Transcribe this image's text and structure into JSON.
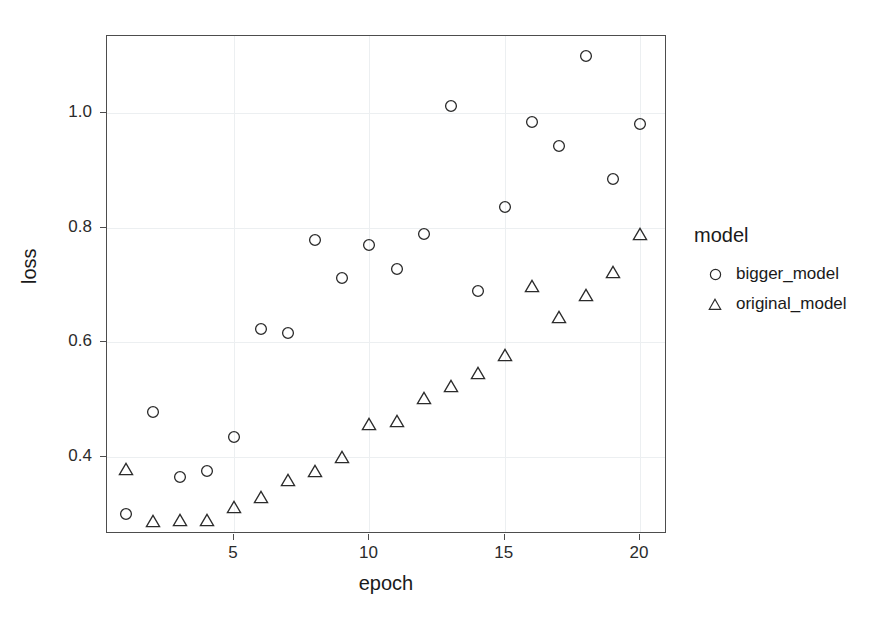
{
  "chart_data": {
    "type": "scatter",
    "title": "",
    "xlabel": "epoch",
    "ylabel": "loss",
    "xlim": [
      0.3,
      21.0
    ],
    "ylim": [
      0.265,
      1.135
    ],
    "xticks": [
      5,
      10,
      15,
      20
    ],
    "xtick_labels": [
      "5",
      "10",
      "15",
      "20"
    ],
    "yticks": [
      0.4,
      0.6,
      0.8,
      1.0
    ],
    "ytick_labels": [
      "0.4",
      "0.6",
      "0.8",
      "1.0"
    ],
    "grid": true,
    "legend_position": "right",
    "legend_title": "model",
    "x": [
      1,
      2,
      3,
      4,
      5,
      6,
      7,
      8,
      9,
      10,
      11,
      12,
      13,
      14,
      15,
      16,
      17,
      18,
      19,
      20
    ],
    "series": [
      {
        "name": "bigger_model",
        "marker": "circle",
        "color": "#2b2b2b",
        "values": [
          0.3,
          0.478,
          0.365,
          0.375,
          0.434,
          0.623,
          0.616,
          0.778,
          0.712,
          0.77,
          0.728,
          0.79,
          1.012,
          0.69,
          0.836,
          0.985,
          0.943,
          1.1,
          0.886,
          0.982
        ]
      },
      {
        "name": "original_model",
        "marker": "triangle",
        "color": "#2b2b2b",
        "values": [
          0.378,
          0.288,
          0.29,
          0.29,
          0.313,
          0.33,
          0.36,
          0.375,
          0.4,
          0.458,
          0.463,
          0.503,
          0.523,
          0.547,
          0.578,
          0.698,
          0.645,
          0.683,
          0.722,
          0.789
        ]
      }
    ]
  },
  "legend": {
    "title": "model",
    "entries": [
      {
        "label": "bigger_model",
        "marker": "circle-marker-icon"
      },
      {
        "label": "original_model",
        "marker": "triangle-marker-icon"
      }
    ]
  },
  "axes": {
    "x_label": "epoch",
    "y_label": "loss"
  },
  "colors": {
    "marker": "#2b2b2b",
    "panel_border": "#4d4d4d",
    "gridline": "#eceff1",
    "background": "#ffffff"
  }
}
